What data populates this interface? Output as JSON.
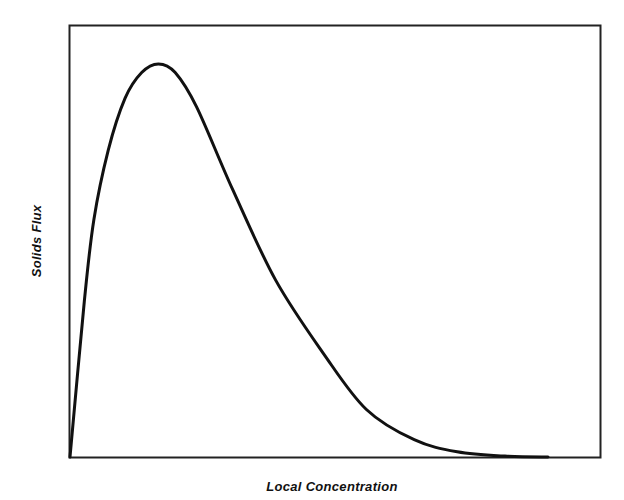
{
  "chart_data": {
    "type": "line",
    "title": "",
    "xlabel": "Local Concentration",
    "ylabel": "Solids Flux",
    "xticks": [],
    "yticks": [],
    "grid": false,
    "legend": null,
    "xlim": [
      0,
      1
    ],
    "ylim": [
      0,
      1
    ],
    "series": [
      {
        "name": "Solids flux curve",
        "x": [
          0.0,
          0.03,
          0.05,
          0.08,
          0.115,
          0.15,
          0.185,
          0.22,
          0.265,
          0.34,
          0.43,
          0.53,
          0.62,
          0.72,
          0.81,
          0.91,
          1.0
        ],
        "y": [
          0.0,
          0.36,
          0.55,
          0.71,
          0.83,
          0.89,
          0.91,
          0.89,
          0.81,
          0.62,
          0.41,
          0.24,
          0.11,
          0.04,
          0.012,
          0.002,
          0.0
        ]
      }
    ]
  },
  "colors": {
    "line": "#111111",
    "frame": "#222222",
    "background": "#ffffff"
  }
}
